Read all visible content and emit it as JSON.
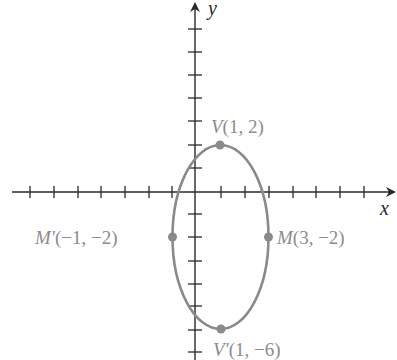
{
  "diagram": {
    "type": "ellipse-on-coordinate-plane",
    "axes": {
      "x_label": "x",
      "y_label": "y",
      "x_ticks": [
        -7,
        -6,
        -5,
        -4,
        -3,
        -2,
        -1,
        1,
        2,
        3,
        4,
        5,
        6,
        7
      ],
      "y_ticks": [
        7,
        6,
        5,
        4,
        3,
        2,
        1,
        -1,
        -2,
        -3,
        -4,
        -5,
        -6,
        -7
      ]
    },
    "ellipse": {
      "center": [
        1,
        -2
      ],
      "semi_major_vertical": 4,
      "semi_minor_horizontal": 2,
      "color": "#8a8a8a"
    },
    "points": [
      {
        "name": "V",
        "coords": "(1, 2)",
        "prefix": "V",
        "text": "(1, 2)"
      },
      {
        "name": "V'",
        "coords": "(1, −6)",
        "prefix": "V′",
        "text": "(1, −6)"
      },
      {
        "name": "M",
        "coords": "(3, −2)",
        "prefix": "M",
        "text": "(3, −2)"
      },
      {
        "name": "M'",
        "coords": "(−1, −2)",
        "prefix": "M′",
        "text": "(−1, −2)"
      }
    ]
  }
}
